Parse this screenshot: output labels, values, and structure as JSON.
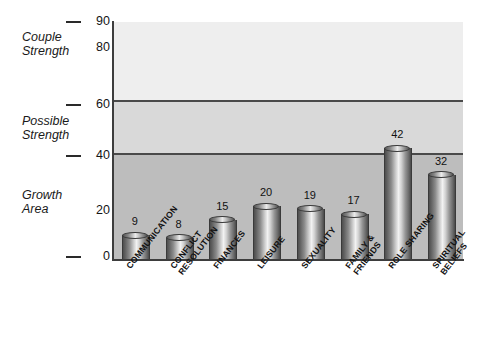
{
  "chart_data": {
    "type": "bar",
    "title": "",
    "xlabel": "",
    "ylabel": "",
    "ylim": [
      0,
      90
    ],
    "grid": false,
    "legend_position": "left-outside",
    "categories": [
      "COMMUNICATION",
      "CONFLICT\nRESOLUTION",
      "FINANCES",
      "LEISURE",
      "SEXUALITY",
      "FAMILY &\nFRIENDS",
      "ROLE SHARING",
      "SPIRITUAL\nBELIEFS"
    ],
    "values": [
      9,
      8,
      15,
      20,
      19,
      17,
      42,
      32
    ],
    "value_labels": [
      "9",
      "8",
      "15",
      "20",
      "19",
      "17",
      "42",
      "32"
    ],
    "y_ticks": [
      0,
      20,
      40,
      60,
      80,
      90
    ],
    "y_tick_labels": [
      "0",
      "20",
      "40",
      "60",
      "80",
      "90"
    ],
    "bands": [
      {
        "label": "Couple\nStrength",
        "range": [
          60,
          90
        ],
        "color": "#eeeeee"
      },
      {
        "label": "Possible\nStrength",
        "range": [
          40,
          60
        ],
        "color": "#d9d9d9"
      },
      {
        "label": "Growth\nArea",
        "range": [
          0,
          40
        ],
        "color": "#bdbdbd"
      }
    ],
    "band_boundaries": [
      40,
      60
    ]
  },
  "axis": {
    "y_labels": [
      {
        "text": "90",
        "value": 90,
        "dash": true,
        "stub": false
      },
      {
        "text": "80",
        "value": 80,
        "dash": false,
        "stub": true
      },
      {
        "text": "60",
        "value": 60,
        "dash": true,
        "stub": false
      },
      {
        "text": "40",
        "value": 40,
        "dash": true,
        "stub": false
      },
      {
        "text": "20",
        "value": 20,
        "dash": false,
        "stub": true
      },
      {
        "text": "0",
        "value": 0,
        "dash": true,
        "stub": false
      }
    ]
  },
  "bands": {
    "couple": "Couple\nStrength",
    "possible": "Possible\nStrength",
    "growth": "Growth\nArea"
  },
  "colors": {
    "band_top": "#eeeeee",
    "band_mid": "#d9d9d9",
    "band_bottom": "#bdbdbd",
    "band_line": "#4a4a4a",
    "axis": "#3d3d3d",
    "text": "#111111",
    "background": "#ffffff"
  }
}
